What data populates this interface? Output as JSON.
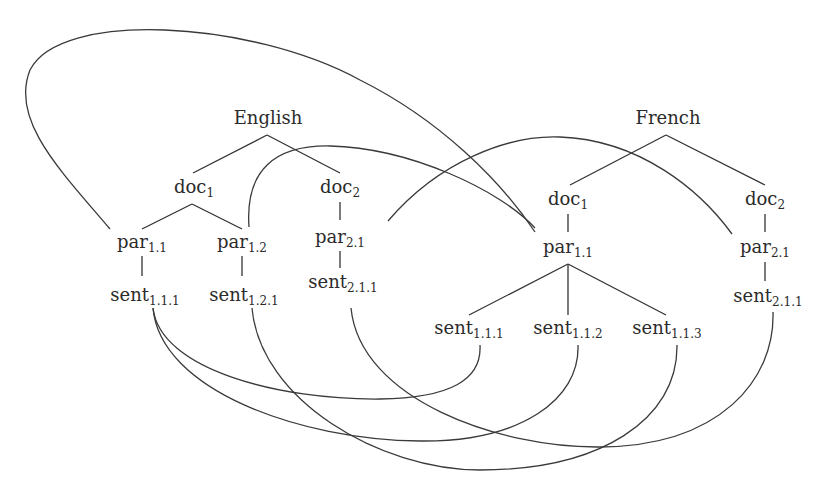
{
  "trees": [
    {
      "id": "en",
      "root": "English",
      "docs": [
        {
          "id": "en-doc1",
          "base": "doc",
          "sub": "1"
        },
        {
          "id": "en-doc2",
          "base": "doc",
          "sub": "2"
        }
      ],
      "pars": [
        {
          "id": "en-par11",
          "base": "par",
          "sub": "1.1",
          "parent": "en-doc1"
        },
        {
          "id": "en-par12",
          "base": "par",
          "sub": "1.2",
          "parent": "en-doc1"
        },
        {
          "id": "en-par21",
          "base": "par",
          "sub": "2.1",
          "parent": "en-doc2"
        }
      ],
      "sents": [
        {
          "id": "en-sent111",
          "base": "sent",
          "sub": "1.1.1",
          "parent": "en-par11"
        },
        {
          "id": "en-sent121",
          "base": "sent",
          "sub": "1.2.1",
          "parent": "en-par12"
        },
        {
          "id": "en-sent211",
          "base": "sent",
          "sub": "2.1.1",
          "parent": "en-par21"
        }
      ]
    },
    {
      "id": "fr",
      "root": "French",
      "docs": [
        {
          "id": "fr-doc1",
          "base": "doc",
          "sub": "1"
        },
        {
          "id": "fr-doc2",
          "base": "doc",
          "sub": "2"
        }
      ],
      "pars": [
        {
          "id": "fr-par11",
          "base": "par",
          "sub": "1.1",
          "parent": "fr-doc1"
        },
        {
          "id": "fr-par21",
          "base": "par",
          "sub": "2.1",
          "parent": "fr-doc2"
        }
      ],
      "sents": [
        {
          "id": "fr-sent111",
          "base": "sent",
          "sub": "1.1.1",
          "parent": "fr-par11"
        },
        {
          "id": "fr-sent112",
          "base": "sent",
          "sub": "1.1.2",
          "parent": "fr-par11"
        },
        {
          "id": "fr-sent113",
          "base": "sent",
          "sub": "1.1.3",
          "parent": "fr-par11"
        },
        {
          "id": "fr-sent211",
          "base": "sent",
          "sub": "2.1.1",
          "parent": "fr-par21"
        }
      ]
    }
  ],
  "alignments": [
    {
      "from": "en-par11",
      "to": "fr-par11"
    },
    {
      "from": "en-par12",
      "to": "fr-par11"
    },
    {
      "from": "en-par21",
      "to": "fr-par21"
    },
    {
      "from": "en-sent111",
      "to": "fr-sent111"
    },
    {
      "from": "en-sent111",
      "to": "fr-sent112"
    },
    {
      "from": "en-sent121",
      "to": "fr-sent113"
    },
    {
      "from": "en-sent211",
      "to": "fr-sent211"
    }
  ]
}
